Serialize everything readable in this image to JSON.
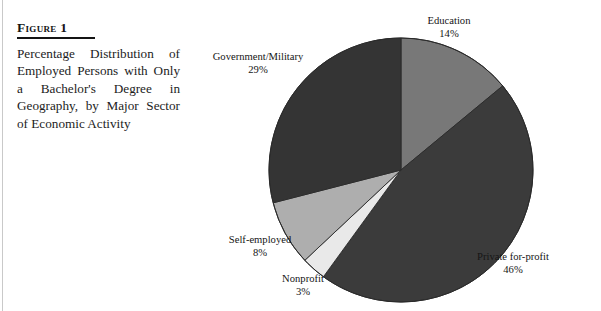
{
  "figure": {
    "label": "Figure 1",
    "caption": "Percentage Distribution of Employed Persons with Only a Bachelor's Degree in Geography, by Major Sector of Economic Activity"
  },
  "chart_data": {
    "type": "pie",
    "title": "Percentage Distribution of Employed Persons with Only a Bachelor's Degree in Geography, by Major Sector of Economic Activity",
    "start_angle_deg": 0,
    "direction": "clockwise",
    "units": "percent",
    "categories": [
      "Education",
      "Private for-profit",
      "Nonprofit",
      "Self-employed",
      "Government/Military"
    ],
    "values": [
      14,
      46,
      3,
      8,
      29
    ],
    "total": 100,
    "legend": "none",
    "slices": [
      {
        "name": "Education",
        "value": 14,
        "value_label": "14%",
        "color": "#787878",
        "start_deg": 0,
        "end_deg": 50.4,
        "label_name": "Education",
        "label_pct": "14%"
      },
      {
        "name": "Private for-profit",
        "value": 46,
        "value_label": "46%",
        "color": "#3b3b3b",
        "start_deg": 50.4,
        "end_deg": 216.0,
        "label_name": "Private for-profit",
        "label_pct": "46%"
      },
      {
        "name": "Nonprofit",
        "value": 3,
        "value_label": "3%",
        "color": "#e9e9e9",
        "start_deg": 216.0,
        "end_deg": 226.8,
        "label_name": "Nonprofit",
        "label_pct": "3%"
      },
      {
        "name": "Self-employed",
        "value": 8,
        "value_label": "8%",
        "color": "#aeaeae",
        "start_deg": 226.8,
        "end_deg": 255.6,
        "label_name": "Self-employed",
        "label_pct": "8%"
      },
      {
        "name": "Government/Military",
        "value": 29,
        "value_label": "29%",
        "color": "#343434",
        "start_deg": 255.6,
        "end_deg": 360.0,
        "label_name": "Government/Military",
        "label_pct": "29%"
      }
    ],
    "geometry": {
      "center_x": 206,
      "center_y": 170,
      "radius": 132
    }
  },
  "colors": {
    "page_background": "#ffffff",
    "text": "#1c1c1c",
    "rule": "#c9c9c9",
    "outline": "#2a2a2a"
  }
}
